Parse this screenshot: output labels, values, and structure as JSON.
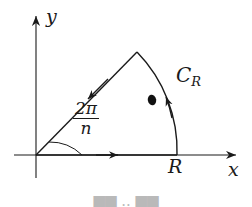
{
  "figure": {
    "background_color": "#ffffff",
    "ink_color": "#1a1a1a",
    "width": 252,
    "height": 207
  },
  "axes": {
    "x_label": "x",
    "y_label": "y",
    "origin": {
      "x": 36,
      "y": 155
    },
    "x_axis_tip": {
      "x": 240,
      "y": 155
    },
    "y_axis_tip": {
      "x": 36,
      "y": 12
    }
  },
  "labels": {
    "radius": "R",
    "arc": "C",
    "arc_subscript": "R",
    "angle_numerator": "2π",
    "angle_denominator": "n"
  },
  "contour": {
    "radius_px": 141,
    "angle_label": "2π/n",
    "apex": {
      "x": 137,
      "y": 52
    },
    "arc_end": {
      "x": 177,
      "y": 155
    },
    "pole_marker": {
      "x": 152,
      "y": 100
    },
    "direction_arrows": [
      {
        "name": "along-positive-real-axis",
        "x": 110,
        "y": 155
      },
      {
        "name": "along-arc-counterclockwise",
        "x": 168,
        "y": 93
      },
      {
        "name": "along-ray-toward-origin",
        "x": 92,
        "y": 94
      }
    ]
  },
  "caption": {
    "text": "██ ·· ██"
  }
}
